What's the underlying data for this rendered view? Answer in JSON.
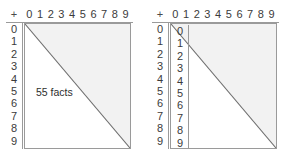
{
  "figure": {
    "background_color": "#ffffff",
    "line_color": "#9a9a9a",
    "diagonal_color": "#6e6e6e",
    "shade_color": "#f2f2f2",
    "text_color": "#3b3b3b"
  },
  "panels": [
    {
      "id": "addition-table-left",
      "operator_symbol": "+",
      "column_headers": [
        "0",
        "1",
        "2",
        "3",
        "4",
        "5",
        "6",
        "7",
        "8",
        "9"
      ],
      "row_headers": [
        "0",
        "1",
        "2",
        "3",
        "4",
        "5",
        "6",
        "7",
        "8",
        "9"
      ],
      "inner_column": [],
      "caption": "55 facts",
      "has_inner_column": false,
      "has_caption": true
    },
    {
      "id": "addition-table-right",
      "operator_symbol": "+",
      "column_headers": [
        "0",
        "1",
        "2",
        "3",
        "4",
        "5",
        "6",
        "7",
        "8",
        "9"
      ],
      "row_headers": [
        "0",
        "1",
        "2",
        "3",
        "4",
        "5",
        "6",
        "7",
        "8",
        "9"
      ],
      "inner_column": [
        "0",
        "1",
        "2",
        "3",
        "4",
        "5",
        "6",
        "7",
        "8",
        "9"
      ],
      "caption": "",
      "has_inner_column": true,
      "has_caption": false
    }
  ]
}
